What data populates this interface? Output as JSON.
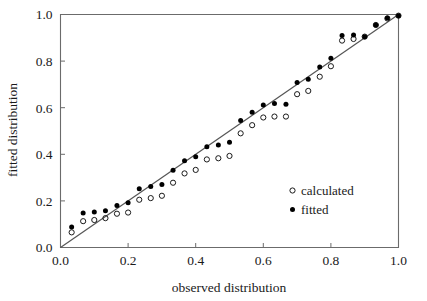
{
  "chart_data": {
    "type": "scatter",
    "title": "",
    "xlabel": "observed distribution",
    "ylabel": "fitted distribution",
    "xlim": [
      0.0,
      1.0
    ],
    "ylim": [
      0.0,
      1.0
    ],
    "xticks": [
      "0.0",
      "0.2",
      "0.4",
      "0.6",
      "0.8",
      "1.0"
    ],
    "yticks": [
      "0.0",
      "0.2",
      "0.4",
      "0.6",
      "0.8",
      "1.0"
    ],
    "xtick_values": [
      0.0,
      0.2,
      0.4,
      0.6,
      0.8,
      1.0
    ],
    "ytick_values": [
      0.0,
      0.2,
      0.4,
      0.6,
      0.8,
      1.0
    ],
    "grid": false,
    "legend_position": "lower-right-inside",
    "reference_line": {
      "name": "one-to-one line",
      "from": [
        0.0,
        0.0
      ],
      "to": [
        1.0,
        1.0
      ],
      "color": "#555555"
    },
    "series": [
      {
        "name": "calculated",
        "marker": "open-circle",
        "color": "#1a1a1a",
        "points": [
          [
            0.033,
            0.065
          ],
          [
            0.067,
            0.113
          ],
          [
            0.1,
            0.118
          ],
          [
            0.133,
            0.126
          ],
          [
            0.167,
            0.145
          ],
          [
            0.2,
            0.15
          ],
          [
            0.233,
            0.205
          ],
          [
            0.267,
            0.212
          ],
          [
            0.3,
            0.222
          ],
          [
            0.333,
            0.278
          ],
          [
            0.367,
            0.318
          ],
          [
            0.4,
            0.333
          ],
          [
            0.433,
            0.378
          ],
          [
            0.467,
            0.383
          ],
          [
            0.5,
            0.393
          ],
          [
            0.533,
            0.49
          ],
          [
            0.567,
            0.525
          ],
          [
            0.6,
            0.558
          ],
          [
            0.633,
            0.562
          ],
          [
            0.667,
            0.562
          ],
          [
            0.7,
            0.658
          ],
          [
            0.733,
            0.672
          ],
          [
            0.767,
            0.733
          ],
          [
            0.8,
            0.778
          ],
          [
            0.833,
            0.888
          ],
          [
            0.867,
            0.895
          ],
          [
            0.9,
            0.905
          ],
          [
            0.933,
            0.955
          ],
          [
            0.967,
            0.983
          ],
          [
            1.0,
            0.995
          ]
        ]
      },
      {
        "name": "fitted",
        "marker": "filled-circle",
        "color": "#000000",
        "points": [
          [
            0.033,
            0.088
          ],
          [
            0.067,
            0.148
          ],
          [
            0.1,
            0.152
          ],
          [
            0.133,
            0.158
          ],
          [
            0.167,
            0.18
          ],
          [
            0.2,
            0.192
          ],
          [
            0.233,
            0.252
          ],
          [
            0.267,
            0.262
          ],
          [
            0.3,
            0.27
          ],
          [
            0.333,
            0.332
          ],
          [
            0.367,
            0.372
          ],
          [
            0.4,
            0.39
          ],
          [
            0.433,
            0.432
          ],
          [
            0.467,
            0.44
          ],
          [
            0.5,
            0.452
          ],
          [
            0.533,
            0.545
          ],
          [
            0.567,
            0.58
          ],
          [
            0.6,
            0.612
          ],
          [
            0.633,
            0.618
          ],
          [
            0.667,
            0.615
          ],
          [
            0.7,
            0.708
          ],
          [
            0.733,
            0.722
          ],
          [
            0.767,
            0.775
          ],
          [
            0.8,
            0.812
          ],
          [
            0.833,
            0.91
          ],
          [
            0.867,
            0.912
          ],
          [
            0.9,
            0.905
          ],
          [
            0.933,
            0.955
          ],
          [
            0.967,
            0.985
          ],
          [
            1.0,
            0.995
          ]
        ]
      }
    ],
    "legend": [
      {
        "label": "calculated",
        "marker": "open-circle"
      },
      {
        "label": "fitted",
        "marker": "filled-circle"
      }
    ]
  },
  "axes": {
    "x_title": "observed distribution",
    "y_title": "fitted distribution"
  },
  "legend": {
    "calculated_label": "calculated",
    "fitted_label": "fitted"
  },
  "ticks": {
    "x": [
      "0.0",
      "0.2",
      "0.4",
      "0.6",
      "0.8",
      "1.0"
    ],
    "y": [
      "0.0",
      "0.2",
      "0.4",
      "0.6",
      "0.8",
      "1.0"
    ]
  },
  "colors": {
    "frame": "#6b6b6b",
    "reference_line": "#555555",
    "marker": "#000000",
    "background": "#ffffff"
  }
}
